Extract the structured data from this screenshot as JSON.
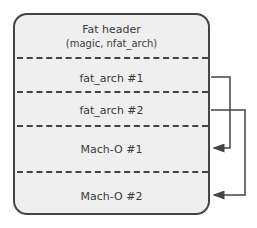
{
  "diagram": {
    "sections": [
      {
        "title": "Fat header",
        "subtitle": "(magic, nfat_arch)"
      },
      {
        "title": "fat_arch #1"
      },
      {
        "title": "fat_arch #2"
      },
      {
        "title": "Mach-O #1"
      },
      {
        "title": "Mach-O #2"
      }
    ],
    "arrows": [
      {
        "from": "fat_arch #1",
        "to": "Mach-O #1"
      },
      {
        "from": "fat_arch #2",
        "to": "Mach-O #2"
      }
    ],
    "colors": {
      "box_fill": "#efefef",
      "stroke": "#444444"
    }
  }
}
